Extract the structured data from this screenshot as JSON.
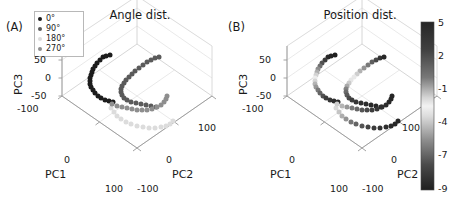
{
  "figure": {
    "width": 463,
    "height": 217,
    "background": "#ffffff"
  },
  "panels": [
    {
      "tag": "(A)",
      "title": "Angle dist.",
      "origin_x": 62,
      "origin_y": 96
    },
    {
      "tag": "(B)",
      "title": "Position dist.",
      "origin_x": 287,
      "origin_y": 96
    }
  ],
  "axes": {
    "pc1_label": "PC1",
    "pc2_label": "PC2",
    "pc3_label": "PC3",
    "pc1_ticks": [
      "-100",
      "0",
      "100"
    ],
    "pc2_ticks": [
      "-100",
      "0",
      "100"
    ],
    "pc3_ticks": [
      "50",
      "0",
      "-50"
    ],
    "pc1_range": [
      -100,
      100
    ],
    "pc2_range": [
      -100,
      100
    ],
    "pc3_range": [
      -100,
      50
    ]
  },
  "legend": {
    "title": "",
    "items": [
      {
        "label": "0°",
        "color": "#1c1c1c"
      },
      {
        "label": "90°",
        "color": "#5a5a5a"
      },
      {
        "label": "180°",
        "color": "#dcdcdc"
      },
      {
        "label": "270°",
        "color": "#8e8e8e"
      }
    ]
  },
  "colorbar": {
    "ticks": [
      "5",
      "2",
      "-1",
      "-4",
      "-7",
      "-9"
    ],
    "tick_values": [
      5,
      2,
      -1,
      -4,
      -7,
      -9
    ],
    "vmin": -9,
    "vmax": 5,
    "colormap": "gray-light-center",
    "gradient_stops": [
      {
        "pos": 0.0,
        "color": "#262626"
      },
      {
        "pos": 0.16,
        "color": "#3f3f3f"
      },
      {
        "pos": 0.33,
        "color": "#787878"
      },
      {
        "pos": 0.45,
        "color": "#d5d5d5"
      },
      {
        "pos": 0.5,
        "color": "#f2f2f2"
      },
      {
        "pos": 0.56,
        "color": "#dcdcdc"
      },
      {
        "pos": 0.7,
        "color": "#8f8f8f"
      },
      {
        "pos": 0.85,
        "color": "#4a4a4a"
      },
      {
        "pos": 1.0,
        "color": "#1f1f1f"
      }
    ]
  },
  "chart_data": {
    "type": "scatter",
    "xlabel": "PC1",
    "ylabel": "PC2",
    "zlabel": "PC3",
    "xlim": [
      -100,
      100
    ],
    "ylim": [
      -100,
      100
    ],
    "zlim": [
      -100,
      50
    ],
    "grid": true,
    "projection": "3d-isometric",
    "panel_a": {
      "title": "Angle dist.",
      "legend_position": "upper-left",
      "series": [
        {
          "name": "0°",
          "color": "#1c1c1c",
          "points_px": [
            [
              103,
              57
            ],
            [
              100,
              60
            ],
            [
              97,
              63
            ],
            [
              95,
              66
            ],
            [
              93,
              69
            ],
            [
              92,
              72
            ],
            [
              91,
              75
            ],
            [
              90,
              78
            ],
            [
              90,
              81
            ],
            [
              90,
              84
            ],
            [
              91,
              87
            ],
            [
              93,
              90
            ],
            [
              95,
              93
            ],
            [
              98,
              96
            ],
            [
              101,
              98
            ],
            [
              105,
              100
            ],
            [
              109,
              101
            ],
            [
              113,
              102
            ],
            [
              110,
              55
            ],
            [
              106,
              56
            ]
          ]
        },
        {
          "name": "90°",
          "color": "#5a5a5a",
          "points_px": [
            [
              151,
              60
            ],
            [
              147,
              62
            ],
            [
              143,
              65
            ],
            [
              139,
              68
            ],
            [
              135,
              71
            ],
            [
              132,
              74
            ],
            [
              129,
              77
            ],
            [
              126,
              80
            ],
            [
              124,
              83
            ],
            [
              122,
              86
            ],
            [
              121,
              89
            ],
            [
              121,
              92
            ],
            [
              122,
              95
            ],
            [
              124,
              98
            ],
            [
              127,
              100
            ],
            [
              131,
              102
            ],
            [
              136,
              103
            ],
            [
              141,
              104
            ],
            [
              146,
              105
            ],
            [
              151,
              106
            ],
            [
              156,
              107
            ],
            [
              155,
              58
            ],
            [
              159,
              57
            ]
          ]
        },
        {
          "name": "180°",
          "color": "#dcdcdc",
          "points_px": [
            [
              111,
              108
            ],
            [
              114,
              112
            ],
            [
              117,
              116
            ],
            [
              121,
              119
            ],
            [
              126,
              122
            ],
            [
              131,
              124
            ],
            [
              137,
              126
            ],
            [
              143,
              127
            ],
            [
              149,
              128
            ],
            [
              155,
              128
            ],
            [
              161,
              127
            ],
            [
              166,
              126
            ],
            [
              170,
              124
            ],
            [
              173,
              121
            ]
          ]
        },
        {
          "name": "270°",
          "color": "#8e8e8e",
          "points_px": [
            [
              112,
              104
            ],
            [
              117,
              106
            ],
            [
              122,
              107
            ],
            [
              127,
              108
            ],
            [
              132,
              109
            ],
            [
              137,
              110
            ],
            [
              142,
              110
            ],
            [
              147,
              110
            ],
            [
              152,
              109
            ],
            [
              157,
              107
            ],
            [
              161,
              105
            ],
            [
              164,
              102
            ],
            [
              166,
              99
            ],
            [
              167,
              96
            ]
          ]
        }
      ]
    },
    "panel_b": {
      "title": "Position dist.",
      "colorbar_range": [
        -9,
        5
      ],
      "description": "Same trajectories colored by continuous position value (-9 to 5); light near center, dark at extremes.",
      "series": [
        {
          "name": "branch-upper-left",
          "points_px": [
            [
              328,
              57
            ],
            [
              325,
              60
            ],
            [
              322,
              63
            ],
            [
              320,
              66
            ],
            [
              318,
              69
            ],
            [
              317,
              72
            ],
            [
              316,
              75
            ],
            [
              315,
              78
            ],
            [
              315,
              81
            ],
            [
              315,
              84
            ],
            [
              316,
              87
            ],
            [
              318,
              90
            ],
            [
              320,
              93
            ],
            [
              323,
              96
            ],
            [
              326,
              98
            ],
            [
              330,
              100
            ],
            [
              334,
              101
            ],
            [
              338,
              102
            ],
            [
              335,
              55
            ],
            [
              331,
              56
            ]
          ],
          "values": [
            -8.5,
            -7.6,
            -6.7,
            -5.8,
            -4.9,
            -4.0,
            -3.1,
            -2.2,
            -1.3,
            -0.7,
            -0.2,
            0.4,
            1.2,
            2.0,
            2.9,
            3.7,
            4.3,
            4.8,
            -9.0,
            -8.8
          ]
        },
        {
          "name": "branch-upper-right",
          "points_px": [
            [
              376,
              60
            ],
            [
              372,
              62
            ],
            [
              368,
              65
            ],
            [
              364,
              68
            ],
            [
              360,
              71
            ],
            [
              357,
              74
            ],
            [
              354,
              77
            ],
            [
              351,
              80
            ],
            [
              349,
              83
            ],
            [
              347,
              86
            ],
            [
              346,
              89
            ],
            [
              346,
              92
            ],
            [
              347,
              95
            ],
            [
              349,
              98
            ],
            [
              352,
              100
            ],
            [
              356,
              102
            ],
            [
              361,
              103
            ],
            [
              366,
              104
            ],
            [
              371,
              105
            ],
            [
              376,
              106
            ],
            [
              381,
              107
            ],
            [
              380,
              58
            ],
            [
              384,
              57
            ]
          ],
          "values": [
            -7.0,
            -6.3,
            -5.5,
            -4.7,
            -3.9,
            -3.2,
            -2.4,
            -1.7,
            -1.1,
            -0.5,
            0.2,
            0.9,
            1.6,
            2.3,
            3.0,
            3.6,
            4.1,
            4.5,
            4.8,
            5.0,
            5.0,
            -8.0,
            -8.6
          ]
        },
        {
          "name": "branch-lower-left",
          "points_px": [
            [
              336,
              108
            ],
            [
              339,
              112
            ],
            [
              342,
              116
            ],
            [
              346,
              119
            ],
            [
              351,
              122
            ],
            [
              356,
              124
            ],
            [
              362,
              126
            ],
            [
              368,
              127
            ],
            [
              374,
              128
            ],
            [
              380,
              128
            ],
            [
              386,
              127
            ],
            [
              391,
              126
            ],
            [
              395,
              124
            ],
            [
              398,
              121
            ]
          ],
          "values": [
            -1.4,
            -1.0,
            -0.6,
            -0.1,
            0.5,
            1.2,
            1.9,
            2.6,
            3.2,
            3.8,
            4.3,
            4.6,
            4.9,
            5.0
          ]
        },
        {
          "name": "branch-lower-right",
          "points_px": [
            [
              337,
              104
            ],
            [
              342,
              106
            ],
            [
              347,
              107
            ],
            [
              352,
              108
            ],
            [
              357,
              109
            ],
            [
              362,
              110
            ],
            [
              367,
              110
            ],
            [
              372,
              110
            ],
            [
              377,
              109
            ],
            [
              382,
              107
            ],
            [
              386,
              105
            ],
            [
              389,
              102
            ],
            [
              391,
              99
            ],
            [
              392,
              96
            ]
          ],
          "values": [
            -1.2,
            -0.7,
            -0.2,
            0.4,
            1.1,
            1.8,
            2.4,
            3.0,
            3.6,
            4.1,
            4.5,
            4.8,
            5.0,
            5.0
          ]
        }
      ]
    }
  }
}
